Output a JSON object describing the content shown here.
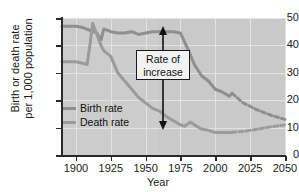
{
  "chart_data": {
    "type": "line",
    "title": "",
    "xlabel": "Year",
    "ylabel": "Birth or death rate per 1,000 population",
    "xlim": [
      1890,
      2050
    ],
    "ylim": [
      0,
      50
    ],
    "xticks": [
      1900,
      1925,
      1950,
      1975,
      2000,
      2025,
      2050
    ],
    "yticks": [
      0,
      10,
      20,
      30,
      40,
      50
    ],
    "grid": true,
    "legend_position": "inside-lower-left",
    "annotations": [
      {
        "text": "Rate of increase",
        "line1": "Rate of",
        "line2": "increase",
        "type": "double-headed-arrow",
        "at_year": 1965,
        "spans_from": 8,
        "spans_to": 45
      }
    ],
    "series": [
      {
        "name": "Birth rate",
        "color": "#8f8f8f",
        "style": "solid-then-dashed",
        "dash_starts_year": 2012,
        "x": [
          1890,
          1900,
          1905,
          1910,
          1913,
          1915,
          1918,
          1920,
          1925,
          1930,
          1935,
          1940,
          1945,
          1950,
          1955,
          1960,
          1965,
          1970,
          1975,
          1980,
          1985,
          1990,
          1995,
          2000,
          2005,
          2010,
          2012,
          2020,
          2030,
          2040,
          2050
        ],
        "y": [
          47,
          47,
          46.5,
          45.5,
          45,
          44.5,
          42,
          46,
          45,
          44.5,
          44.5,
          45,
          44,
          44.5,
          45,
          45,
          45,
          45,
          44.5,
          39,
          33,
          29,
          27,
          24,
          23,
          21.5,
          22.5,
          19,
          16.5,
          14.5,
          13
        ]
      },
      {
        "name": "Death rate",
        "color": "#9b9b9b",
        "style": "solid-then-dashed",
        "dash_starts_year": 2012,
        "x": [
          1890,
          1900,
          1905,
          1908,
          1910,
          1912,
          1915,
          1918,
          1920,
          1925,
          1930,
          1935,
          1940,
          1945,
          1950,
          1955,
          1960,
          1965,
          1970,
          1975,
          1978,
          1982,
          1985,
          1990,
          1995,
          2000,
          2005,
          2010,
          2012,
          2020,
          2030,
          2040,
          2050
        ],
        "y": [
          34,
          34,
          33.5,
          33,
          40,
          48,
          44,
          40,
          38,
          36,
          30,
          27,
          24,
          21,
          19,
          17,
          16,
          14,
          12.5,
          11,
          10.5,
          12,
          11,
          9.5,
          9,
          8.2,
          8.2,
          8.2,
          8.3,
          8.6,
          9.4,
          10.3,
          11
        ]
      }
    ]
  },
  "axis": {
    "y_title_line1": "Birth or death rate",
    "y_title_line2": "per 1,000 population",
    "x_title": "Year",
    "yticklabels": [
      "0",
      "10",
      "20",
      "30",
      "40",
      "50"
    ],
    "xticklabels": [
      "1900",
      "1925",
      "1950",
      "1975",
      "2000",
      "2025",
      "2050"
    ]
  },
  "legend": {
    "items": [
      {
        "label": "Birth rate",
        "color": "#8f8f8f"
      },
      {
        "label": "Death rate",
        "color": "#9b9b9b"
      }
    ]
  },
  "annotation": {
    "line1": "Rate of",
    "line2": "increase"
  },
  "colors": {
    "plot_background": "#c9c9c9",
    "gridline": "#e2e2e2",
    "axis": "#2a2a2a",
    "birth_rate": "#8f8f8f",
    "death_rate": "#9b9b9b",
    "annotation_border": "#1a1a1a",
    "annotation_fill": "#f2f2f2"
  }
}
